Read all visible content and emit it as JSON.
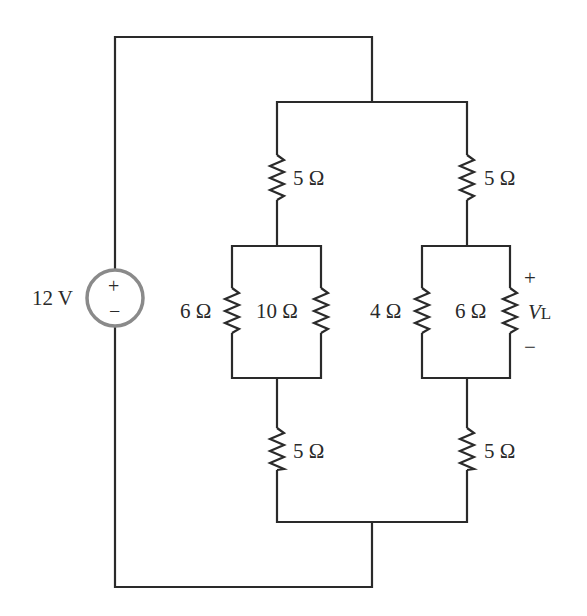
{
  "diagram": {
    "type": "circuit-schematic",
    "source": {
      "label": "12 V",
      "plus": "+",
      "minus": "−"
    },
    "left_branch": {
      "top_resistor": "5 Ω",
      "parallel_a": "6 Ω",
      "parallel_b": "10 Ω",
      "bottom_resistor": "5 Ω"
    },
    "right_branch": {
      "top_resistor": "5 Ω",
      "parallel_a": "4 Ω",
      "parallel_b": "6 Ω",
      "bottom_resistor": "5 Ω",
      "load_voltage": {
        "symbol": "V",
        "subscript": "L",
        "plus": "+",
        "minus": "−"
      }
    },
    "colors": {
      "wire": "#2a2a2a",
      "source_circle": "#8a8a8a",
      "background": "#ffffff"
    }
  }
}
